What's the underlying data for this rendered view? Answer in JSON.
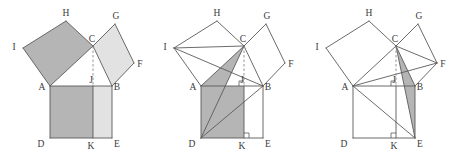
{
  "figure": {
    "width": 455,
    "height": 161,
    "background_color": "#ffffff",
    "stroke_color": "#5a5a5a",
    "label_color": "#3a3a3a",
    "fill_dark": "#b5b5b5",
    "fill_light": "#e2e2e2",
    "fill_none": "#ffffff",
    "dash_color": "#8a8a8a"
  },
  "geometry": {
    "note": "Shared local point coordinates per panel, panel width 152px.",
    "points": {
      "A": {
        "x": 50,
        "y": 86,
        "label": "A"
      },
      "B": {
        "x": 112,
        "y": 86,
        "label": "B"
      },
      "C": {
        "x": 93,
        "y": 46,
        "label": "C"
      },
      "D": {
        "x": 50,
        "y": 138,
        "label": "D"
      },
      "E": {
        "x": 112,
        "y": 138,
        "label": "E"
      },
      "J": {
        "x": 93,
        "y": 86,
        "label": "J"
      },
      "K": {
        "x": 93,
        "y": 138,
        "label": "K"
      },
      "F": {
        "x": 134,
        "y": 63,
        "label": "F"
      },
      "G": {
        "x": 115,
        "y": 24,
        "label": "G"
      },
      "H": {
        "x": 66,
        "y": 21,
        "label": "H"
      },
      "I": {
        "x": 23,
        "y": 48,
        "label": "I"
      }
    },
    "label_offsets": {
      "A": {
        "dx": -8,
        "dy": 4
      },
      "B": {
        "dx": 5,
        "dy": 4
      },
      "C": {
        "dx": -1,
        "dy": -4
      },
      "D": {
        "dx": -9,
        "dy": 9
      },
      "E": {
        "dx": 5,
        "dy": 9
      },
      "J": {
        "dx": -2,
        "dy": -3
      },
      "K": {
        "dx": -2,
        "dy": 11
      },
      "F": {
        "dx": 6,
        "dy": 4
      },
      "G": {
        "dx": 1,
        "dy": -5
      },
      "H": {
        "dx": 0,
        "dy": -5
      },
      "I": {
        "dx": -9,
        "dy": 2
      }
    }
  },
  "panels": [
    {
      "id": "panel-1",
      "name": "initial-configuration",
      "offset_x": 0,
      "regions": [
        {
          "name": "square-on-leg-AC",
          "points": "A,C,H,I",
          "fill": "#b5b5b5"
        },
        {
          "name": "square-on-leg-BC",
          "points": "C,B,F,G",
          "fill": "#e2e2e2"
        },
        {
          "name": "rectangle-ADKJ",
          "points": "A,J,K,D",
          "fill": "#b5b5b5"
        },
        {
          "name": "rectangle-JBEK",
          "points": "J,B,E,K",
          "fill": "#e2e2e2"
        }
      ],
      "solid_lines": [
        {
          "name": "edge-AC",
          "from": "A",
          "to": "C"
        },
        {
          "name": "edge-CB",
          "from": "C",
          "to": "B"
        },
        {
          "name": "edge-AB",
          "from": "A",
          "to": "B"
        },
        {
          "name": "edge-AI",
          "from": "A",
          "to": "I"
        },
        {
          "name": "edge-IH",
          "from": "I",
          "to": "H"
        },
        {
          "name": "edge-HC",
          "from": "H",
          "to": "C"
        },
        {
          "name": "edge-CG",
          "from": "C",
          "to": "G"
        },
        {
          "name": "edge-GF",
          "from": "G",
          "to": "F"
        },
        {
          "name": "edge-FB",
          "from": "F",
          "to": "B"
        },
        {
          "name": "edge-AD",
          "from": "A",
          "to": "D"
        },
        {
          "name": "edge-DE",
          "from": "D",
          "to": "E"
        },
        {
          "name": "edge-EB",
          "from": "E",
          "to": "B"
        },
        {
          "name": "edge-JK",
          "from": "J",
          "to": "K"
        }
      ],
      "dashed_lines": [
        {
          "name": "altitude-CJ",
          "from": "C",
          "to": "J"
        }
      ],
      "right_angle_marks": [],
      "labels": [
        "A",
        "B",
        "C",
        "D",
        "E",
        "F",
        "G",
        "H",
        "I",
        "J",
        "K"
      ]
    },
    {
      "id": "panel-2",
      "name": "left-square-equals-left-rectangle",
      "offset_x": 151,
      "regions": [
        {
          "name": "square-on-leg-AC",
          "points": "A,C,H,I",
          "fill": "#ffffff"
        },
        {
          "name": "square-on-leg-BC",
          "points": "C,B,F,G",
          "fill": "#ffffff"
        },
        {
          "name": "rectangle-ADKJ",
          "points": "A,J,K,D",
          "fill": "#b5b5b5"
        },
        {
          "name": "rectangle-JBEK",
          "points": "J,B,E,K",
          "fill": "#ffffff"
        },
        {
          "name": "triangle-ACD-shaded",
          "points": "A,C,D",
          "fill": "#b5b5b5"
        }
      ],
      "solid_lines": [
        {
          "name": "edge-AC",
          "from": "A",
          "to": "C"
        },
        {
          "name": "edge-CB",
          "from": "C",
          "to": "B"
        },
        {
          "name": "edge-AB",
          "from": "A",
          "to": "B"
        },
        {
          "name": "edge-AI",
          "from": "A",
          "to": "I"
        },
        {
          "name": "edge-IH",
          "from": "I",
          "to": "H"
        },
        {
          "name": "edge-HC",
          "from": "H",
          "to": "C"
        },
        {
          "name": "edge-CG",
          "from": "C",
          "to": "G"
        },
        {
          "name": "edge-GF",
          "from": "G",
          "to": "F"
        },
        {
          "name": "edge-FB",
          "from": "F",
          "to": "B"
        },
        {
          "name": "edge-AD",
          "from": "A",
          "to": "D"
        },
        {
          "name": "edge-DE",
          "from": "D",
          "to": "E"
        },
        {
          "name": "edge-EB",
          "from": "E",
          "to": "B"
        },
        {
          "name": "edge-JK",
          "from": "J",
          "to": "K"
        },
        {
          "name": "cevian-IC",
          "from": "I",
          "to": "C"
        },
        {
          "name": "cevian-IB",
          "from": "I",
          "to": "B"
        },
        {
          "name": "cevian-DC",
          "from": "D",
          "to": "C"
        },
        {
          "name": "cevian-DB",
          "from": "D",
          "to": "B"
        }
      ],
      "dashed_lines": [
        {
          "name": "altitude-CJ",
          "from": "C",
          "to": "J"
        }
      ],
      "right_angle_marks": [
        {
          "name": "right-angle-at-J",
          "vertex": "J",
          "dir_x": -1,
          "dir_y": -1,
          "size": 5
        },
        {
          "name": "right-angle-at-K",
          "vertex": "K",
          "dir_x": 1,
          "dir_y": -1,
          "size": 5
        }
      ],
      "labels": [
        "A",
        "B",
        "C",
        "D",
        "E",
        "F",
        "G",
        "H",
        "I",
        "J",
        "K"
      ]
    },
    {
      "id": "panel-3",
      "name": "right-square-equals-right-rectangle",
      "offset_x": 303,
      "regions": [
        {
          "name": "square-on-leg-AC",
          "points": "A,C,H,I",
          "fill": "#ffffff"
        },
        {
          "name": "square-on-leg-BC",
          "points": "C,B,F,G",
          "fill": "#ffffff"
        },
        {
          "name": "rectangle-ADKJ",
          "points": "A,J,K,D",
          "fill": "#ffffff"
        },
        {
          "name": "rectangle-JBEK",
          "points": "J,B,E,K",
          "fill": "#ffffff"
        },
        {
          "name": "triangle-CBE-shaded",
          "points": "C,B,E",
          "fill": "#b5b5b5"
        }
      ],
      "solid_lines": [
        {
          "name": "edge-AC",
          "from": "A",
          "to": "C"
        },
        {
          "name": "edge-CB",
          "from": "C",
          "to": "B"
        },
        {
          "name": "edge-AB",
          "from": "A",
          "to": "B"
        },
        {
          "name": "edge-AI",
          "from": "A",
          "to": "I"
        },
        {
          "name": "edge-IH",
          "from": "I",
          "to": "H"
        },
        {
          "name": "edge-HC",
          "from": "H",
          "to": "C"
        },
        {
          "name": "edge-CG",
          "from": "C",
          "to": "G"
        },
        {
          "name": "edge-GF",
          "from": "G",
          "to": "F"
        },
        {
          "name": "edge-FB",
          "from": "F",
          "to": "B"
        },
        {
          "name": "edge-AD",
          "from": "A",
          "to": "D"
        },
        {
          "name": "edge-DE",
          "from": "D",
          "to": "E"
        },
        {
          "name": "edge-EB",
          "from": "E",
          "to": "B"
        },
        {
          "name": "edge-JK",
          "from": "J",
          "to": "K"
        },
        {
          "name": "cevian-FC",
          "from": "F",
          "to": "C"
        },
        {
          "name": "cevian-FA",
          "from": "F",
          "to": "A"
        },
        {
          "name": "cevian-EC",
          "from": "E",
          "to": "C"
        },
        {
          "name": "cevian-EA",
          "from": "E",
          "to": "A"
        }
      ],
      "dashed_lines": [
        {
          "name": "altitude-CJ",
          "from": "C",
          "to": "J"
        }
      ],
      "right_angle_marks": [
        {
          "name": "right-angle-at-J",
          "vertex": "J",
          "dir_x": -1,
          "dir_y": -1,
          "size": 5
        },
        {
          "name": "right-angle-at-K",
          "vertex": "K",
          "dir_x": -1,
          "dir_y": -1,
          "size": 5
        }
      ],
      "labels": [
        "A",
        "B",
        "C",
        "D",
        "E",
        "F",
        "G",
        "H",
        "I",
        "J",
        "K"
      ]
    }
  ]
}
